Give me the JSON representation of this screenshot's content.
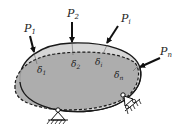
{
  "diagram": {
    "type": "elastic-body-loads",
    "colors": {
      "original_fill": "#d4d4d4",
      "deformed_fill": "#a8a8a8",
      "outline": "#1a1a1a",
      "background": "#ffffff"
    },
    "loads": [
      {
        "symbol": "P",
        "subscript": "1"
      },
      {
        "symbol": "P",
        "subscript": "2"
      },
      {
        "symbol": "P",
        "subscript": "i"
      },
      {
        "symbol": "P",
        "subscript": "n"
      }
    ],
    "displacements": [
      {
        "symbol": "δ",
        "subscript": "1"
      },
      {
        "symbol": "δ",
        "subscript": "2"
      },
      {
        "symbol": "δ",
        "subscript": "i"
      },
      {
        "symbol": "δ",
        "subscript": "n"
      }
    ],
    "supports": [
      {
        "kind": "pin",
        "position": "bottom"
      },
      {
        "kind": "roller",
        "position": "right"
      }
    ]
  }
}
